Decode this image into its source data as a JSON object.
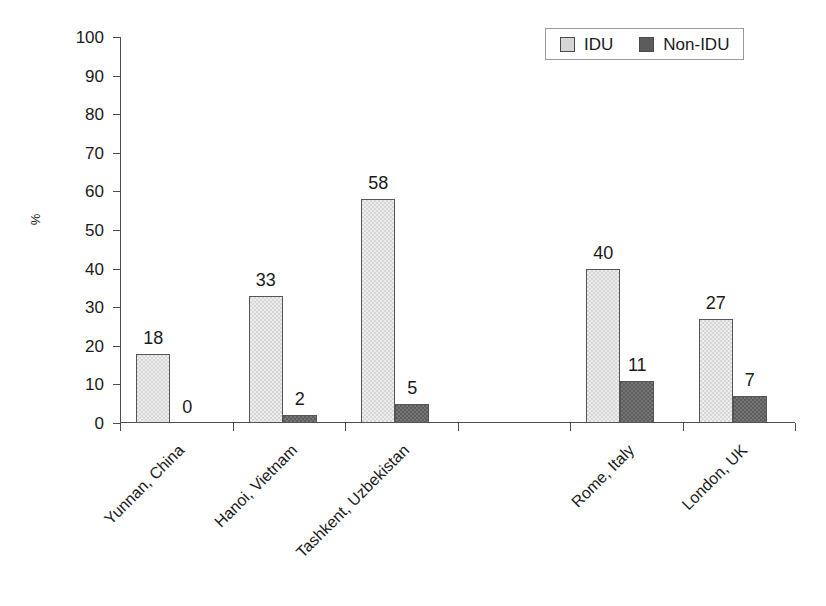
{
  "chart_data": {
    "type": "bar",
    "title": "",
    "subtitle": "",
    "xlabel": "",
    "ylabel": "%",
    "ylim": [
      0,
      100
    ],
    "ytick_step": 10,
    "yticks": [
      0,
      10,
      20,
      30,
      40,
      50,
      60,
      70,
      80,
      90,
      100
    ],
    "grid": false,
    "legend_position": "top-right",
    "categories": [
      "Yunnan, China",
      "Hanoi, Vietnam",
      "Tashkent, Uzbekistan",
      "",
      "Rome, Italy",
      "London, UK"
    ],
    "series": [
      {
        "name": "IDU",
        "color": "#d6d6d6",
        "values": [
          18,
          33,
          58,
          null,
          40,
          27
        ],
        "labels": [
          "18",
          "33",
          "58",
          "",
          "40",
          "27"
        ]
      },
      {
        "name": "Non-IDU",
        "color": "#5c5c5c",
        "values": [
          0,
          2,
          5,
          null,
          11,
          7
        ],
        "labels": [
          "0",
          "2",
          "5",
          "",
          "11",
          "7"
        ]
      }
    ]
  },
  "legend": {
    "entries": [
      {
        "label": "IDU",
        "color": "#d6d6d6"
      },
      {
        "label": "Non-IDU",
        "color": "#5c5c5c"
      }
    ]
  },
  "axis": {
    "y_label": "%",
    "tick_labels": [
      "100",
      "90",
      "80",
      "70",
      "60",
      "50",
      "40",
      "30",
      "20",
      "10",
      "0"
    ]
  }
}
